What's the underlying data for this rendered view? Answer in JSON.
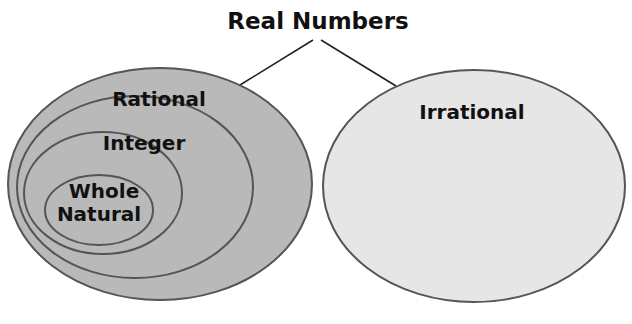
{
  "diagram": {
    "title": "Real Numbers",
    "sets": {
      "rational": "Rational",
      "integer": "Integer",
      "whole": "Whole",
      "natural": "Natural",
      "irrational": "Irrational"
    },
    "colors": {
      "rational_fill": "#b9b9b9",
      "irrational_fill": "#e6e6e6",
      "outline": "#555555",
      "connector": "#222222"
    }
  }
}
